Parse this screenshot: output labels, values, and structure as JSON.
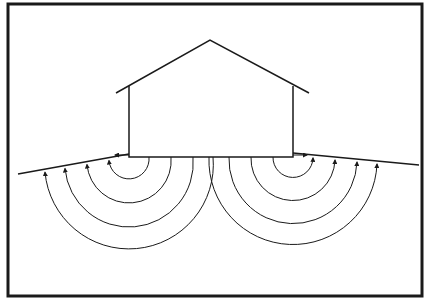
{
  "diagram": {
    "title": "",
    "colors": {
      "stroke": "#1a1a1a",
      "background": "#ffffff"
    },
    "frame": {
      "x": 8,
      "y": 4,
      "w": 414,
      "h": 292
    },
    "house": {
      "roof_apex": [
        210,
        40
      ],
      "left_eave": [
        116,
        93
      ],
      "right_eave": [
        309,
        93
      ],
      "wall_left_x": 129,
      "wall_right_x": 293,
      "wall_top_y": 86,
      "base_y": 157
    },
    "ground": {
      "left": [
        [
          18,
          174
        ],
        [
          129,
          154
        ]
      ],
      "right": [
        [
          293,
          153
        ],
        [
          419,
          165
        ]
      ]
    },
    "arc_groups": [
      {
        "center": [
          129,
          157
        ],
        "radii": [
          20,
          42,
          64,
          84
        ],
        "side": "left"
      },
      {
        "center": [
          293,
          157
        ],
        "radii": [
          20,
          42,
          64,
          84
        ],
        "side": "right"
      }
    ]
  }
}
